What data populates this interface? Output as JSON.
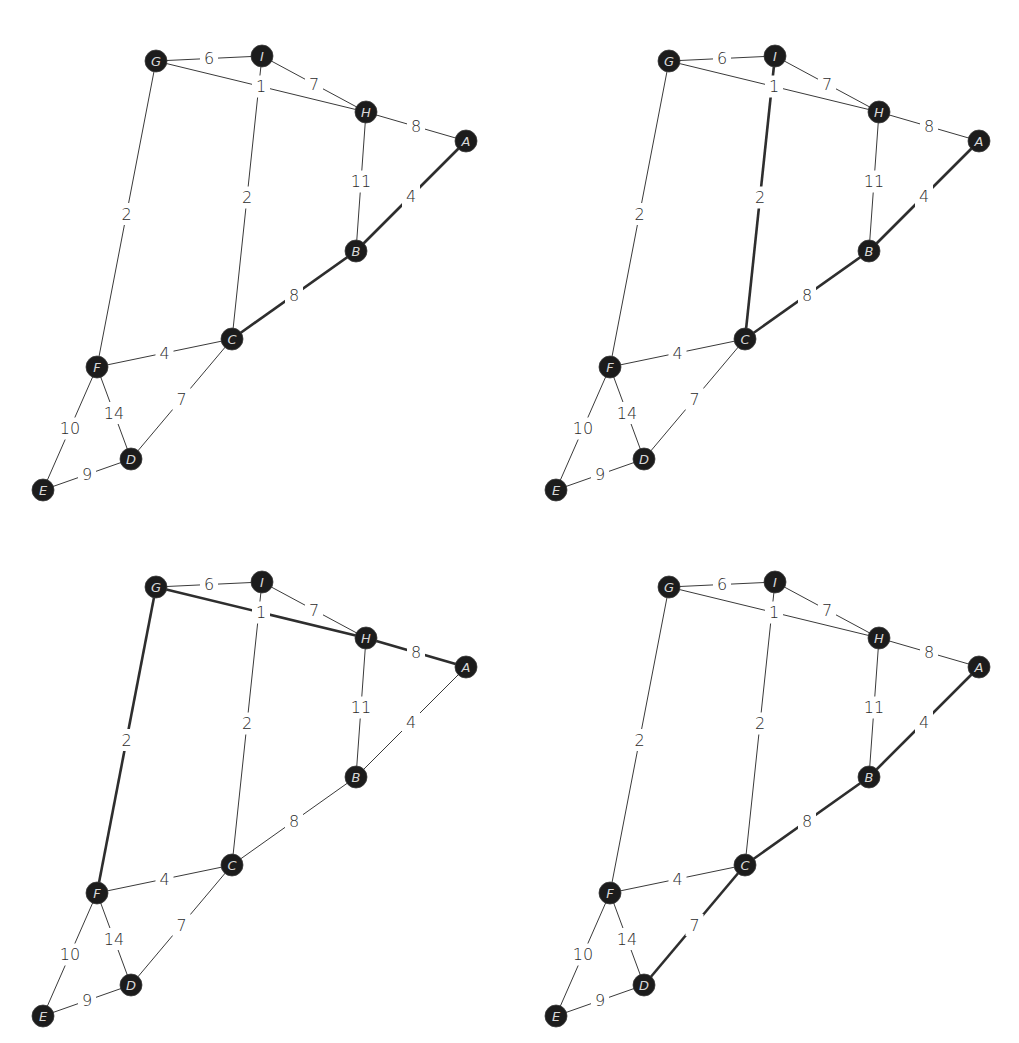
{
  "diagram": {
    "title": "",
    "colors": {
      "node_fill": "#1c1c1c",
      "node_text": "#d8d8d8",
      "edge": "#3a3a3a",
      "edge_highlight": "#2e2e2e",
      "label": "#2b2b2b",
      "background": "#ffffff"
    },
    "nodes": [
      {
        "id": "G",
        "x": 156,
        "y": 61
      },
      {
        "id": "I",
        "x": 262,
        "y": 56
      },
      {
        "id": "H",
        "x": 366,
        "y": 112
      },
      {
        "id": "A",
        "x": 466,
        "y": 141
      },
      {
        "id": "B",
        "x": 356,
        "y": 251
      },
      {
        "id": "C",
        "x": 232,
        "y": 339
      },
      {
        "id": "F",
        "x": 97,
        "y": 367
      },
      {
        "id": "D",
        "x": 131,
        "y": 459
      },
      {
        "id": "E",
        "x": 43,
        "y": 490
      }
    ],
    "edges": [
      {
        "from": "G",
        "to": "I",
        "weight": "6"
      },
      {
        "from": "G",
        "to": "H",
        "weight": "1"
      },
      {
        "from": "I",
        "to": "H",
        "weight": "7"
      },
      {
        "from": "H",
        "to": "A",
        "weight": "8"
      },
      {
        "from": "H",
        "to": "B",
        "weight": "11"
      },
      {
        "from": "A",
        "to": "B",
        "weight": "4"
      },
      {
        "from": "G",
        "to": "F",
        "weight": "2"
      },
      {
        "from": "I",
        "to": "C",
        "weight": "2"
      },
      {
        "from": "B",
        "to": "C",
        "weight": "8"
      },
      {
        "from": "F",
        "to": "C",
        "weight": "4"
      },
      {
        "from": "F",
        "to": "E",
        "weight": "10"
      },
      {
        "from": "F",
        "to": "D",
        "weight": "14"
      },
      {
        "from": "C",
        "to": "D",
        "weight": "7"
      },
      {
        "from": "E",
        "to": "D",
        "weight": "9"
      }
    ],
    "panels": [
      {
        "name": "panel-top-left",
        "offset_x": 0,
        "offset_y": 0,
        "highlighted_path": [
          "A",
          "B",
          "C"
        ]
      },
      {
        "name": "panel-top-right",
        "offset_x": 513,
        "offset_y": 0,
        "highlighted_path": [
          "A",
          "B",
          "C",
          "I"
        ]
      },
      {
        "name": "panel-bottom-left",
        "offset_x": 0,
        "offset_y": 526,
        "highlighted_path": [
          "A",
          "H",
          "G",
          "F"
        ]
      },
      {
        "name": "panel-bottom-right",
        "offset_x": 513,
        "offset_y": 526,
        "highlighted_path": [
          "A",
          "B",
          "C",
          "D"
        ]
      }
    ]
  }
}
